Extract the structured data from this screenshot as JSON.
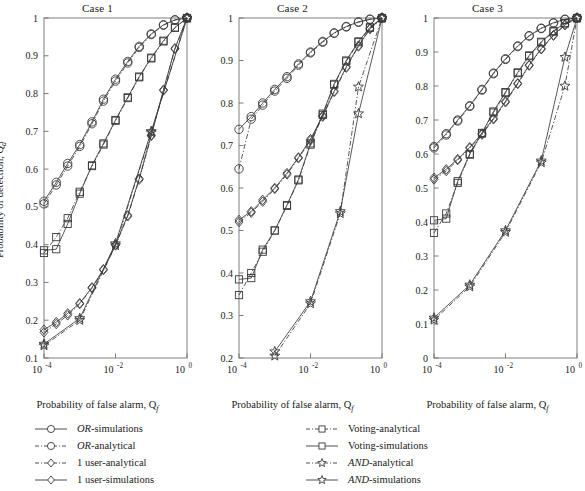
{
  "figure": {
    "axis_labels": {
      "x": "Probability of false alarm, Q",
      "x_sub": "f",
      "y": "Probability of detection, Q",
      "y_sub": "d"
    },
    "xticks": [
      {
        "label": "10",
        "exp": "-4",
        "value": 0.0001
      },
      {
        "label": "10",
        "exp": "-2",
        "value": 0.01
      },
      {
        "label": "10",
        "exp": "0",
        "value": 1
      }
    ],
    "xlim": [
      0.0001,
      1
    ],
    "xscale": "log"
  },
  "legend": {
    "left": [
      {
        "name": "OR-simulations",
        "em": "OR",
        "rest": "-simulations",
        "marker": "circle",
        "line": "solid"
      },
      {
        "name": "OR-analytical",
        "em": "OR",
        "rest": "-analytical",
        "marker": "circle",
        "line": "dashdot"
      },
      {
        "name": "1 user-analytical",
        "em": "",
        "rest": "1 user-analytical",
        "marker": "diamond",
        "line": "dashdot"
      },
      {
        "name": "1 user-simulations",
        "em": "",
        "rest": "1 user-simulations",
        "marker": "diamond",
        "line": "solid"
      }
    ],
    "right": [
      {
        "name": "Voting-analytical",
        "em": "",
        "rest": "Voting-analytical",
        "marker": "square",
        "line": "dashdot"
      },
      {
        "name": "Voting-simulations",
        "em": "",
        "rest": "Voting-simulations",
        "marker": "square",
        "line": "solid"
      },
      {
        "name": "AND-analytical",
        "em": "AND",
        "rest": "-analytical",
        "marker": "star",
        "line": "dashdot"
      },
      {
        "name": "AND-simulations",
        "em": "AND",
        "rest": "-simulations",
        "marker": "star",
        "line": "solid"
      }
    ]
  },
  "chart_data": [
    {
      "type": "line",
      "title": "Case 1",
      "xlabel": "Probability of false alarm, Q_f",
      "ylabel": "Probability of detection, Q_d",
      "xscale": "log",
      "xlim": [
        0.0001,
        1
      ],
      "ylim": [
        0.1,
        1
      ],
      "yticks": [
        0.1,
        0.2,
        0.3,
        0.4,
        0.5,
        0.6,
        0.7,
        0.8,
        0.9,
        1
      ],
      "ytick_labels": [
        "0.1",
        "0.2",
        "0.3",
        "0.4",
        "0.5",
        "0.6",
        "0.7",
        "0.8",
        "0.9",
        "1"
      ],
      "grid": false,
      "legend_position": "below-figure",
      "series": [
        {
          "name": "OR-simulations",
          "marker": "circle",
          "line": "solid",
          "x": [
            0.0001,
            0.00022,
            0.00046,
            0.001,
            0.0022,
            0.0046,
            0.01,
            0.022,
            0.046,
            0.1,
            0.22,
            0.46,
            1
          ],
          "y": [
            0.515,
            0.565,
            0.615,
            0.665,
            0.725,
            0.785,
            0.838,
            0.885,
            0.925,
            0.958,
            0.982,
            0.995,
            1.0
          ]
        },
        {
          "name": "OR-analytical",
          "marker": "circle",
          "line": "dashdot",
          "x": [
            0.0001,
            0.00022,
            0.00046,
            0.001,
            0.0022,
            0.0046,
            0.01,
            0.022,
            0.046,
            0.1,
            0.22,
            0.46,
            1
          ],
          "y": [
            0.508,
            0.558,
            0.608,
            0.66,
            0.72,
            0.78,
            0.833,
            0.881,
            0.922,
            0.956,
            0.981,
            0.995,
            1.0
          ]
        },
        {
          "name": "Voting-simulations",
          "marker": "square",
          "line": "solid",
          "x": [
            0.0001,
            0.00022,
            0.00046,
            0.001,
            0.0022,
            0.0046,
            0.01,
            0.022,
            0.046,
            0.1,
            0.22,
            0.46,
            1
          ],
          "y": [
            0.385,
            0.388,
            0.455,
            0.535,
            0.61,
            0.668,
            0.73,
            0.79,
            0.845,
            0.895,
            0.94,
            0.975,
            1.0
          ]
        },
        {
          "name": "Voting-analytical",
          "marker": "square",
          "line": "dashdot",
          "x": [
            0.0001,
            0.00022,
            0.00046,
            0.001,
            0.0022,
            0.0046,
            0.01,
            0.022,
            0.046,
            0.1,
            0.22,
            0.46,
            1
          ],
          "y": [
            0.378,
            0.42,
            0.47,
            0.54,
            0.608,
            0.665,
            0.728,
            0.788,
            0.843,
            0.893,
            0.938,
            0.974,
            1.0
          ]
        },
        {
          "name": "1 user-simulations",
          "marker": "diamond",
          "line": "solid",
          "x": [
            0.0001,
            0.00022,
            0.00046,
            0.001,
            0.0022,
            0.0046,
            0.01,
            0.022,
            0.046,
            0.1,
            0.22,
            0.46,
            1
          ],
          "y": [
            0.175,
            0.195,
            0.218,
            0.245,
            0.287,
            0.335,
            0.4,
            0.478,
            0.575,
            0.69,
            0.81,
            0.92,
            1.0
          ]
        },
        {
          "name": "1 user-analytical",
          "marker": "diamond",
          "line": "dashdot",
          "x": [
            0.0001,
            0.00022,
            0.00046,
            0.001,
            0.0022,
            0.0046,
            0.01,
            0.022,
            0.046,
            0.1,
            0.22,
            0.46,
            1
          ],
          "y": [
            0.168,
            0.19,
            0.213,
            0.243,
            0.285,
            0.333,
            0.398,
            0.475,
            0.572,
            0.688,
            0.808,
            0.918,
            1.0
          ]
        },
        {
          "name": "AND-simulations",
          "marker": "star",
          "line": "solid",
          "x": [
            0.0001,
            0.001,
            0.01,
            0.1,
            1
          ],
          "y": [
            0.137,
            0.205,
            0.403,
            0.7,
            1.0
          ]
        },
        {
          "name": "AND-analytical",
          "marker": "star",
          "line": "dashdot",
          "x": [
            0.0001,
            0.001,
            0.01,
            0.1,
            1
          ],
          "y": [
            0.133,
            0.2,
            0.398,
            0.697,
            1.0
          ]
        }
      ]
    },
    {
      "type": "line",
      "title": "Case 2",
      "xlabel": "Probability of false alarm, Q_f",
      "ylabel": "Probability of detection, Q_d",
      "xscale": "log",
      "xlim": [
        0.0001,
        1
      ],
      "ylim": [
        0.2,
        1
      ],
      "yticks": [
        0.2,
        0.3,
        0.4,
        0.5,
        0.6,
        0.7,
        0.8,
        0.9,
        1
      ],
      "ytick_labels": [
        "0.2",
        "0.3",
        "0.4",
        "0.5",
        "0.6",
        "0.7",
        "0.8",
        "0.9",
        "1"
      ],
      "grid": false,
      "legend_position": "below-figure",
      "series": [
        {
          "name": "OR-simulations",
          "marker": "circle",
          "line": "solid",
          "x": [
            0.0001,
            0.00022,
            0.00046,
            0.001,
            0.0022,
            0.0046,
            0.01,
            0.022,
            0.046,
            0.1,
            0.22,
            0.46,
            1
          ],
          "y": [
            0.738,
            0.768,
            0.8,
            0.832,
            0.862,
            0.892,
            0.92,
            0.945,
            0.965,
            0.98,
            0.991,
            0.997,
            1.0
          ]
        },
        {
          "name": "OR-analytical",
          "marker": "circle",
          "line": "dashdot",
          "x": [
            0.0001,
            0.00022,
            0.00046,
            0.001,
            0.0022,
            0.0046,
            0.01,
            0.022,
            0.046,
            0.1,
            0.22,
            0.46,
            1
          ],
          "y": [
            0.645,
            0.762,
            0.795,
            0.828,
            0.858,
            0.889,
            0.918,
            0.943,
            0.964,
            0.979,
            0.99,
            0.997,
            1.0
          ]
        },
        {
          "name": "Voting-simulations",
          "marker": "square",
          "line": "solid",
          "x": [
            0.0001,
            0.00022,
            0.00046,
            0.001,
            0.0022,
            0.0046,
            0.01,
            0.022,
            0.046,
            0.1,
            0.22,
            0.46,
            1
          ],
          "y": [
            0.385,
            0.388,
            0.455,
            0.5,
            0.56,
            0.62,
            0.705,
            0.775,
            0.845,
            0.9,
            0.945,
            0.978,
            1.0
          ]
        },
        {
          "name": "Voting-analytical",
          "marker": "square",
          "line": "dashdot",
          "x": [
            0.0001,
            0.00022,
            0.00046,
            0.001,
            0.0022,
            0.0046,
            0.01,
            0.022,
            0.046,
            0.1,
            0.22,
            0.46,
            1
          ],
          "y": [
            0.348,
            0.4,
            0.45,
            0.5,
            0.558,
            0.618,
            0.702,
            0.772,
            0.843,
            0.898,
            0.943,
            0.977,
            1.0
          ]
        },
        {
          "name": "1 user-simulations",
          "marker": "diamond",
          "line": "solid",
          "x": [
            0.0001,
            0.00022,
            0.00046,
            0.001,
            0.0022,
            0.0046,
            0.01,
            0.022,
            0.046,
            0.1,
            0.22,
            0.46,
            1
          ],
          "y": [
            0.525,
            0.545,
            0.572,
            0.6,
            0.635,
            0.672,
            0.715,
            0.77,
            0.828,
            0.885,
            0.935,
            0.975,
            1.0
          ]
        },
        {
          "name": "1 user-analytical",
          "marker": "diamond",
          "line": "dashdot",
          "x": [
            0.0001,
            0.00022,
            0.00046,
            0.001,
            0.0022,
            0.0046,
            0.01,
            0.022,
            0.046,
            0.1,
            0.22,
            0.46,
            1
          ],
          "y": [
            0.52,
            0.542,
            0.568,
            0.598,
            0.632,
            0.67,
            0.712,
            0.768,
            0.826,
            0.883,
            0.933,
            0.974,
            1.0
          ]
        },
        {
          "name": "AND-simulations",
          "marker": "star",
          "line": "solid",
          "x": [
            0.001,
            0.01,
            0.068,
            0.22,
            1
          ],
          "y": [
            0.215,
            0.333,
            0.545,
            0.775,
            1.0
          ]
        },
        {
          "name": "AND-analytical",
          "marker": "star",
          "line": "dashdot",
          "x": [
            0.001,
            0.01,
            0.068,
            0.22,
            1
          ],
          "y": [
            0.205,
            0.328,
            0.54,
            0.838,
            1.0
          ]
        }
      ]
    },
    {
      "type": "line",
      "title": "Case 3",
      "xlabel": "Probability of false alarm, Q_f",
      "ylabel": "Probability of detection, Q_d",
      "xscale": "log",
      "xlim": [
        0.0001,
        1
      ],
      "ylim": [
        0,
        1
      ],
      "yticks": [
        0,
        0.1,
        0.2,
        0.3,
        0.4,
        0.5,
        0.6,
        0.7,
        0.8,
        0.9,
        1
      ],
      "ytick_labels": [
        "0",
        "0.1",
        "0.2",
        "0.3",
        "0.4",
        "0.5",
        "0.6",
        "0.7",
        "0.8",
        "0.9",
        "1"
      ],
      "grid": false,
      "legend_position": "below-figure",
      "series": [
        {
          "name": "OR-simulations",
          "marker": "circle",
          "line": "solid",
          "x": [
            0.0001,
            0.00022,
            0.00046,
            0.001,
            0.0022,
            0.0046,
            0.01,
            0.022,
            0.046,
            0.1,
            0.22,
            0.46,
            1
          ],
          "y": [
            0.622,
            0.66,
            0.7,
            0.742,
            0.79,
            0.838,
            0.88,
            0.918,
            0.948,
            0.97,
            0.986,
            0.996,
            1.0
          ]
        },
        {
          "name": "OR-analytical",
          "marker": "circle",
          "line": "dashdot",
          "x": [
            0.0001,
            0.00022,
            0.00046,
            0.001,
            0.0022,
            0.0046,
            0.01,
            0.022,
            0.046,
            0.1,
            0.22,
            0.46,
            1
          ],
          "y": [
            0.618,
            0.656,
            0.697,
            0.74,
            0.788,
            0.836,
            0.878,
            0.916,
            0.947,
            0.969,
            0.985,
            0.996,
            1.0
          ]
        },
        {
          "name": "Voting-simulations",
          "marker": "square",
          "line": "solid",
          "x": [
            0.0001,
            0.00022,
            0.00046,
            0.001,
            0.0022,
            0.0046,
            0.01,
            0.022,
            0.046,
            0.1,
            0.22,
            0.46,
            1
          ],
          "y": [
            0.405,
            0.41,
            0.52,
            0.6,
            0.662,
            0.725,
            0.782,
            0.84,
            0.89,
            0.93,
            0.962,
            0.985,
            1.0
          ]
        },
        {
          "name": "Voting-analytical",
          "marker": "square",
          "line": "dashdot",
          "x": [
            0.0001,
            0.00022,
            0.00046,
            0.001,
            0.0022,
            0.0046,
            0.01,
            0.022,
            0.046,
            0.1,
            0.22,
            0.46,
            1
          ],
          "y": [
            0.368,
            0.425,
            0.515,
            0.598,
            0.66,
            0.722,
            0.78,
            0.838,
            0.888,
            0.928,
            0.96,
            0.984,
            1.0
          ]
        },
        {
          "name": "1 user-simulations",
          "marker": "diamond",
          "line": "solid",
          "x": [
            0.0001,
            0.00022,
            0.00046,
            0.001,
            0.0022,
            0.0046,
            0.01,
            0.022,
            0.046,
            0.1,
            0.22,
            0.46,
            1
          ],
          "y": [
            0.53,
            0.555,
            0.585,
            0.62,
            0.66,
            0.705,
            0.755,
            0.808,
            0.862,
            0.91,
            0.95,
            0.98,
            1.0
          ]
        },
        {
          "name": "1 user-analytical",
          "marker": "diamond",
          "line": "dashdot",
          "x": [
            0.0001,
            0.00022,
            0.00046,
            0.001,
            0.0022,
            0.0046,
            0.01,
            0.022,
            0.046,
            0.1,
            0.22,
            0.46,
            1
          ],
          "y": [
            0.525,
            0.55,
            0.582,
            0.617,
            0.657,
            0.702,
            0.752,
            0.806,
            0.86,
            0.908,
            0.948,
            0.979,
            1.0
          ]
        },
        {
          "name": "AND-simulations",
          "marker": "star",
          "line": "solid",
          "x": [
            0.0001,
            0.001,
            0.01,
            0.1,
            0.46,
            1
          ],
          "y": [
            0.118,
            0.215,
            0.375,
            0.58,
            0.885,
            1.0
          ]
        },
        {
          "name": "AND-analytical",
          "marker": "star",
          "line": "dashdot",
          "x": [
            0.0001,
            0.001,
            0.01,
            0.1,
            0.46,
            1
          ],
          "y": [
            0.112,
            0.21,
            0.37,
            0.575,
            0.8,
            1.0
          ]
        }
      ]
    }
  ]
}
